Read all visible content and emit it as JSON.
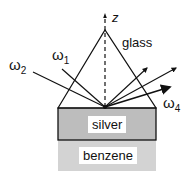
{
  "diagram": {
    "axis_label": "z",
    "prism_label": "glass",
    "beams": {
      "incident_1": {
        "label": "ω",
        "sub": "1"
      },
      "incident_2": {
        "label": "ω",
        "sub": "2"
      },
      "output_4": {
        "label": "ω",
        "sub": "4"
      }
    },
    "layers": {
      "silver": "silver",
      "benzene": "benzene"
    },
    "colors": {
      "line": "#111111",
      "silver_fill": "#bdbdbd",
      "benzene_fill": "#d3d3d3",
      "background": "#ffffff"
    }
  }
}
